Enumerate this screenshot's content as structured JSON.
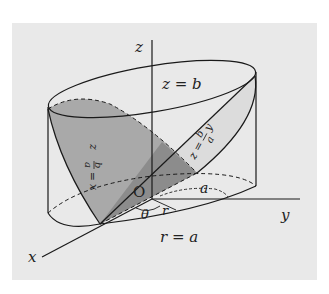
{
  "figure": {
    "background_color": "#e9e9e9",
    "light_region_color": "#d9d9d9",
    "mid_region_color": "#a7a7a7",
    "dark_region_color": "#8e8e8e",
    "line_color": "#1a1a1a"
  },
  "axes": {
    "x_label": "x",
    "y_label": "y",
    "z_label": "z",
    "origin_label": "O"
  },
  "labels": {
    "top_plane": "z = b",
    "bottom_circle": "r = a",
    "radius_a": "a",
    "theta": "θ",
    "r": "r",
    "plane_left": {
      "lhs": "z",
      "eq": "=",
      "num": "b",
      "den": "a",
      "var": "x"
    },
    "plane_right": {
      "lhs": "z",
      "eq": "=",
      "num": "b",
      "den": "a",
      "var": "y"
    }
  }
}
